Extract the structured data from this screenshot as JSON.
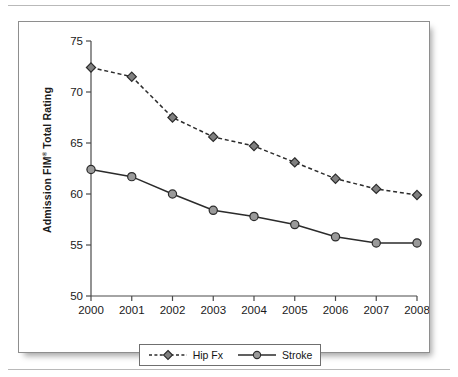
{
  "figure": {
    "ylabel_text": "Admission FIM",
    "ylabel_sup": "®",
    "ylabel_tail": " Total Rating"
  },
  "legend": {
    "items": [
      {
        "label": "Hip Fx",
        "marker": "diamond-marker",
        "line": "dashed"
      },
      {
        "label": "Stroke",
        "marker": "circle-marker",
        "line": "solid"
      }
    ]
  },
  "colors": {
    "marker_fill": "#808080",
    "marker_stroke": "#2b2b2b",
    "line": "#2b2b2b",
    "axis": "#4a4a4a",
    "text": "#1a1a1a",
    "frame": "#8e8e8e"
  },
  "chart_data": {
    "type": "line",
    "title": "",
    "xlabel": "",
    "ylabel": "Admission FIM® Total Rating",
    "categories": [
      "2000",
      "2001",
      "2002",
      "2003",
      "2004",
      "2005",
      "2006",
      "2007",
      "2008"
    ],
    "x": [
      2000,
      2001,
      2002,
      2003,
      2004,
      2005,
      2006,
      2007,
      2008
    ],
    "ylim": [
      50,
      75
    ],
    "yticks": [
      50,
      55,
      60,
      65,
      70,
      75
    ],
    "ytick_labels": [
      "50",
      "55",
      "60",
      "65",
      "70",
      "75"
    ],
    "grid": false,
    "legend_position": "bottom",
    "series": [
      {
        "name": "Hip Fx",
        "style": "dashed",
        "marker": "diamond",
        "values": [
          72.4,
          71.5,
          67.5,
          65.6,
          64.7,
          63.1,
          61.5,
          60.5,
          59.9
        ]
      },
      {
        "name": "Stroke",
        "style": "solid",
        "marker": "circle",
        "values": [
          62.4,
          61.7,
          60.0,
          58.4,
          57.8,
          57.0,
          55.8,
          55.2,
          55.2
        ]
      }
    ]
  }
}
